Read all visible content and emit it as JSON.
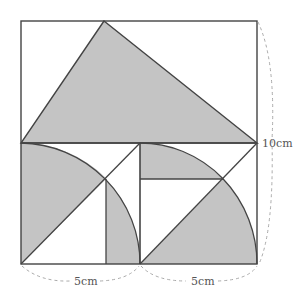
{
  "diagram": {
    "type": "geometry-figure",
    "labels": {
      "height": "10cm",
      "left_width": "5cm",
      "right_width": "5cm"
    },
    "colors": {
      "shade": "#c4c4c4",
      "line": "#444444",
      "dashed": "#aaaaaa",
      "text": "#555555"
    },
    "shapes": [
      {
        "name": "outer-rectangle",
        "kind": "rectangle"
      },
      {
        "name": "top-triangle",
        "kind": "triangle",
        "shaded": true
      },
      {
        "name": "left-square",
        "kind": "square",
        "side": "5cm"
      },
      {
        "name": "left-quarter-circle",
        "kind": "arc",
        "center": "bottom-left of left square"
      },
      {
        "name": "left-diagonal",
        "kind": "line"
      },
      {
        "name": "left-vertical-segment",
        "kind": "line"
      },
      {
        "name": "right-square",
        "kind": "square",
        "side": "5cm"
      },
      {
        "name": "right-quarter-circle",
        "kind": "arc",
        "center": "bottom-left of right square"
      },
      {
        "name": "right-diagonal",
        "kind": "line"
      },
      {
        "name": "right-horizontal-segment",
        "kind": "line"
      }
    ]
  }
}
